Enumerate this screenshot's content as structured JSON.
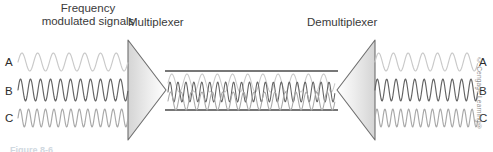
{
  "figure": {
    "title_top_left": "Frequency\nmodulated signals",
    "mux_label": "Multiplexer",
    "demux_label": "Demultiplexer",
    "credit": "© Cengage Learning®",
    "caption": "Figure 8-6",
    "channel_labels_left": [
      "A",
      "B",
      "C"
    ],
    "channel_labels_right": [
      "A",
      "B",
      "C"
    ]
  },
  "colors": {
    "background": "#ffffff",
    "signal_a": "#c9c9c9",
    "signal_b": "#636363",
    "signal_c": "#a8a8a8",
    "cable_line": "#4a4a4a",
    "triangle_stroke": "#6e6e6e",
    "triangle_fill_dark": "#d6d6d6",
    "triangle_fill_light": "#ffffff",
    "text": "#3a3a3a",
    "credit_text": "#8d8d8d"
  },
  "chart_data": {
    "type": "line",
    "xlabel": "",
    "ylabel": "",
    "grid": false,
    "legend_position": "none",
    "series": [
      {
        "name": "A",
        "color": "#c9c9c9",
        "cycles": 7,
        "amplitude": 9,
        "baseline_y": 62,
        "left_x0": 18,
        "left_x1": 128,
        "right_x0": 375,
        "right_x1": 478
      },
      {
        "name": "B",
        "color": "#636363",
        "cycles": 11,
        "amplitude": 11,
        "baseline_y": 90,
        "left_x0": 18,
        "left_x1": 128,
        "right_x0": 375,
        "right_x1": 478
      },
      {
        "name": "C",
        "color": "#a8a8a8",
        "cycles": 13,
        "amplitude": 9,
        "baseline_y": 118,
        "left_x0": 18,
        "left_x1": 128,
        "right_x0": 375,
        "right_x1": 478
      }
    ],
    "trunk": {
      "x0": 165,
      "x1": 338,
      "top_line_y": 71,
      "bottom_line_y": 110,
      "combined_series": [
        {
          "name": "A",
          "color": "#c9c9c9",
          "cycles": 11,
          "amplitude": 9,
          "baseline_y": 83
        },
        {
          "name": "B",
          "color": "#636363",
          "cycles": 21,
          "amplitude": 10,
          "baseline_y": 92
        },
        {
          "name": "C",
          "color": "#a8a8a8",
          "cycles": 16,
          "amplitude": 9,
          "baseline_y": 101
        }
      ]
    },
    "mux_triangle": {
      "apex_x": 166,
      "base_x": 128,
      "top_y": 40,
      "bottom_y": 140,
      "direction": "right"
    },
    "demux_triangle": {
      "apex_x": 337,
      "base_x": 375,
      "top_y": 40,
      "bottom_y": 140,
      "direction": "left"
    }
  }
}
